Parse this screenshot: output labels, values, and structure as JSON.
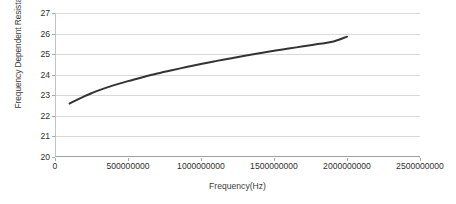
{
  "chart_data": {
    "type": "line",
    "title": "",
    "xlabel": "Frequency(Hz)",
    "ylabel": "Frequency Dependent Resistance(Ohm)",
    "xlim": [
      0,
      2500000000
    ],
    "ylim": [
      20,
      27
    ],
    "grid": "horizontal",
    "legend": "none",
    "x_tick_labels": [
      "0",
      "500000000",
      "1000000000",
      "1500000000",
      "2000000000",
      "2500000000"
    ],
    "x_tick_values": [
      0,
      500000000,
      1000000000,
      1500000000,
      2000000000,
      2500000000
    ],
    "y_tick_labels": [
      "20",
      "21",
      "22",
      "23",
      "24",
      "25",
      "26",
      "27"
    ],
    "y_tick_values": [
      20,
      21,
      22,
      23,
      24,
      25,
      26,
      27
    ],
    "series": [
      {
        "name": "Frequency Dependent Resistance",
        "color": "#333333",
        "x": [
          100000000,
          150000000,
          200000000,
          250000000,
          300000000,
          400000000,
          500000000,
          600000000,
          700000000,
          800000000,
          900000000,
          1000000000,
          1100000000,
          1200000000,
          1300000000,
          1400000000,
          1500000000,
          1600000000,
          1700000000,
          1800000000,
          1900000000,
          2000000000
        ],
        "y": [
          22.6,
          22.78,
          22.95,
          23.1,
          23.24,
          23.48,
          23.69,
          23.88,
          24.06,
          24.22,
          24.37,
          24.52,
          24.66,
          24.79,
          24.92,
          25.04,
          25.16,
          25.27,
          25.38,
          25.49,
          25.6,
          25.85
        ]
      }
    ]
  },
  "axis": {
    "y_title": "Frequency Dependent Resistance(Ohm)",
    "x_title": "Frequency(Hz)"
  },
  "colors": {
    "series": "#333333",
    "gridline": "#d9d9d9",
    "axis": "#a8a8a8",
    "text": "#2e2e2e",
    "background": "#ffffff"
  }
}
